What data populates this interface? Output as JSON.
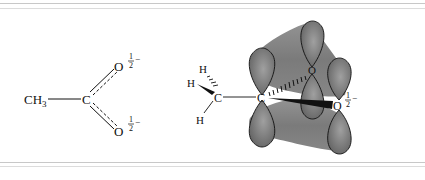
{
  "figure": {
    "left_structure": {
      "name": "acetate resonance hybrid",
      "methyl_label": "CH",
      "methyl_subscript": "3",
      "carbon_label": "C",
      "oxygen_top_label": "O",
      "oxygen_bottom_label": "O",
      "charge_numerator": "1",
      "charge_denominator": "2",
      "charge_sign": "−"
    },
    "right_structure": {
      "name": "acetate pi-orbital overlap",
      "h_top": "H",
      "h_left": "H",
      "h_bottom": "H",
      "methyl_carbon": "C",
      "carboxyl_carbon": "C",
      "oxygen_back": "O",
      "oxygen_front": "O",
      "charge_numerator": "1",
      "charge_denominator": "2",
      "charge_sign": "−"
    },
    "colors": {
      "orbital_fill": "#7a7a7a",
      "orbital_highlight": "#a8a8a8",
      "line": "#111111",
      "rule": "#c8c8c8"
    }
  }
}
